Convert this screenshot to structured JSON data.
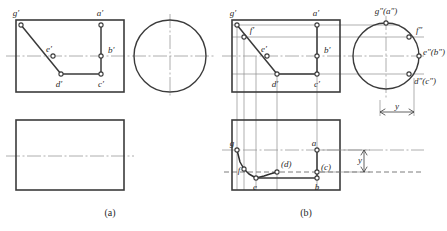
{
  "figure": {
    "captions": [
      {
        "id": "cap_a",
        "text": "(a)",
        "x": 110,
        "y": 216
      },
      {
        "id": "cap_b",
        "text": "(b)",
        "x": 306,
        "y": 216
      }
    ],
    "colors": {
      "outline": "#3b3b3b",
      "thin": "#8c8c8c",
      "center": "#9a9a9a",
      "text": "#2a2a2a",
      "marker_fill": "#ffffff",
      "curve": "#2f2f2f"
    }
  },
  "panel_a": {
    "name": "panel-a",
    "front_view": {
      "x": 16,
      "y": 20,
      "w": 108,
      "h": 72
    },
    "top_view": {
      "x": 16,
      "y": 120,
      "w": 108,
      "h": 70
    },
    "side_circle": {
      "cx": 170,
      "cy": 56,
      "r": 36
    },
    "polyline_points": "21,25 61,74 101,74",
    "segment_ab": "101,25 101,74",
    "center_lines": [
      {
        "id": "front_h",
        "x1": 6,
        "y1": 56,
        "x2": 214,
        "y2": 56
      },
      {
        "id": "circle_v",
        "x1": 170,
        "y1": 14,
        "x2": 170,
        "y2": 98
      },
      {
        "id": "top_h",
        "x1": 6,
        "y1": 156,
        "x2": 134,
        "y2": 156
      }
    ],
    "markers": [
      {
        "id": "g1",
        "x": 21,
        "y": 25
      },
      {
        "id": "a1",
        "x": 101,
        "y": 25
      },
      {
        "id": "b1",
        "x": 101,
        "y": 56
      },
      {
        "id": "e1",
        "x": 53,
        "y": 56
      },
      {
        "id": "d1",
        "x": 61,
        "y": 74
      },
      {
        "id": "c1",
        "x": 101,
        "y": 74
      }
    ],
    "labels": [
      {
        "id": "lbl_g1",
        "text": "g′",
        "x": 16,
        "y": 16,
        "anchor": "middle",
        "size": 9
      },
      {
        "id": "lbl_a1",
        "text": "a′",
        "x": 100,
        "y": 16,
        "anchor": "middle",
        "size": 9
      },
      {
        "id": "lbl_b1",
        "text": "b′",
        "x": 108,
        "y": 53,
        "anchor": "start",
        "size": 9
      },
      {
        "id": "lbl_e1",
        "text": "e′",
        "x": 49,
        "y": 52,
        "anchor": "middle",
        "size": 9
      },
      {
        "id": "lbl_d1",
        "text": "d′",
        "x": 59,
        "y": 87,
        "anchor": "middle",
        "size": 9
      },
      {
        "id": "lbl_c1",
        "text": "c′",
        "x": 101,
        "y": 87,
        "anchor": "middle",
        "size": 9
      }
    ]
  },
  "panel_b": {
    "name": "panel-b",
    "front_view": {
      "x": 232,
      "y": 20,
      "w": 108,
      "h": 72
    },
    "top_view": {
      "x": 232,
      "y": 120,
      "w": 108,
      "h": 70
    },
    "side_circle": {
      "cx": 386,
      "cy": 56,
      "r": 33
    },
    "polyline_points": "237,25 277,74 317,74",
    "segment_ab": "317,25 317,74",
    "front_center_h": {
      "x1": 222,
      "y1": 56,
      "x2": 424,
      "y2": 56
    },
    "circle_center_v": {
      "x1": 386,
      "y1": 16,
      "x2": 386,
      "y2": 100
    },
    "top_center_h": {
      "x1": 222,
      "y1": 150,
      "x2": 424,
      "y2": 150
    },
    "top_dash_h": {
      "x1": 224,
      "y1": 172,
      "x2": 424,
      "y2": 172
    },
    "projection_h_lines": [
      {
        "id": "ph_g",
        "x1": 232,
        "y1": 25,
        "x2": 400,
        "y2": 25
      },
      {
        "id": "ph_f",
        "x1": 232,
        "y1": 37,
        "x2": 424,
        "y2": 37
      },
      {
        "id": "ph_c",
        "x1": 232,
        "y1": 74,
        "x2": 424,
        "y2": 74
      }
    ],
    "projection_v_lines": [
      {
        "id": "pv_g",
        "x1": 237,
        "y1": 25,
        "x2": 237,
        "y2": 190
      },
      {
        "id": "pv_f",
        "x1": 244,
        "y1": 37,
        "x2": 244,
        "y2": 190
      },
      {
        "id": "pv_e",
        "x1": 256,
        "y1": 56,
        "x2": 256,
        "y2": 190
      },
      {
        "id": "pv_d",
        "x1": 277,
        "y1": 74,
        "x2": 277,
        "y2": 190
      },
      {
        "id": "pv_c",
        "x1": 317,
        "y1": 25,
        "x2": 317,
        "y2": 190
      }
    ],
    "front_markers": [
      {
        "id": "g1",
        "x": 237,
        "y": 25
      },
      {
        "id": "f1",
        "x": 244,
        "y": 37
      },
      {
        "id": "e1",
        "x": 267,
        "y": 56
      },
      {
        "id": "a1",
        "x": 317,
        "y": 25
      },
      {
        "id": "b1",
        "x": 317,
        "y": 56
      },
      {
        "id": "d1",
        "x": 277,
        "y": 74
      },
      {
        "id": "c1",
        "x": 317,
        "y": 74
      }
    ],
    "front_labels": [
      {
        "id": "lbl_g1",
        "text": "g′",
        "x": 233,
        "y": 16,
        "anchor": "middle",
        "size": 9
      },
      {
        "id": "lbl_f1",
        "text": "f′",
        "x": 252,
        "y": 33,
        "anchor": "middle",
        "size": 9
      },
      {
        "id": "lbl_e1",
        "text": "e′",
        "x": 264,
        "y": 52,
        "anchor": "middle",
        "size": 9
      },
      {
        "id": "lbl_a1",
        "text": "a′",
        "x": 316,
        "y": 16,
        "anchor": "middle",
        "size": 9
      },
      {
        "id": "lbl_b1",
        "text": "b′",
        "x": 324,
        "y": 53,
        "anchor": "start",
        "size": 9
      },
      {
        "id": "lbl_d1",
        "text": "d′",
        "x": 275,
        "y": 87,
        "anchor": "middle",
        "size": 9
      },
      {
        "id": "lbl_c1",
        "text": "c′",
        "x": 317,
        "y": 87,
        "anchor": "middle",
        "size": 9
      }
    ],
    "circle_markers": [
      {
        "id": "g2a2",
        "x": 386,
        "y": 23
      },
      {
        "id": "f2",
        "x": 409,
        "y": 37
      },
      {
        "id": "e2b2",
        "x": 419,
        "y": 56
      },
      {
        "id": "d2c2",
        "x": 409,
        "y": 74
      }
    ],
    "circle_labels": [
      {
        "id": "lbl_g2",
        "text": "g″(a″)",
        "x": 386,
        "y": 14,
        "anchor": "middle",
        "size": 9
      },
      {
        "id": "lbl_f2",
        "text": "f″",
        "x": 416,
        "y": 33,
        "anchor": "start",
        "size": 9
      },
      {
        "id": "lbl_e2",
        "text": "e″(b″)",
        "x": 423,
        "y": 55,
        "anchor": "start",
        "size": 9
      },
      {
        "id": "lbl_d2",
        "text": "d″(c″)",
        "x": 414,
        "y": 84,
        "anchor": "start",
        "size": 9
      }
    ],
    "top_curve": "237,150 240,162 244,169 249,174 256,178 264,176 270,174 277,172",
    "top_line_e_b": "256,178 317,178",
    "top_seg_ab": "317,150 317,178",
    "top_markers": [
      {
        "id": "g",
        "x": 237,
        "y": 150
      },
      {
        "id": "f",
        "x": 244,
        "y": 169
      },
      {
        "id": "e",
        "x": 256,
        "y": 178
      },
      {
        "id": "d",
        "x": 277,
        "y": 172
      },
      {
        "id": "a",
        "x": 317,
        "y": 150
      },
      {
        "id": "c",
        "x": 317,
        "y": 172
      },
      {
        "id": "b",
        "x": 317,
        "y": 178
      }
    ],
    "top_labels": [
      {
        "id": "lbl_g",
        "text": "g",
        "x": 232,
        "y": 146,
        "anchor": "middle",
        "size": 9
      },
      {
        "id": "lbl_f",
        "text": "f",
        "x": 239,
        "y": 173,
        "anchor": "middle",
        "size": 9
      },
      {
        "id": "lbl_e",
        "text": "e",
        "x": 255,
        "y": 190,
        "anchor": "middle",
        "size": 9
      },
      {
        "id": "lbl_d",
        "text": "(d)",
        "x": 281,
        "y": 167,
        "anchor": "start",
        "size": 9
      },
      {
        "id": "lbl_a",
        "text": "a",
        "x": 314,
        "y": 146,
        "anchor": "middle",
        "size": 9
      },
      {
        "id": "lbl_c",
        "text": "(c)",
        "x": 321,
        "y": 170,
        "anchor": "start",
        "size": 9
      },
      {
        "id": "lbl_b",
        "text": "b",
        "x": 317,
        "y": 190,
        "anchor": "middle",
        "size": 9
      }
    ],
    "dimensions": [
      {
        "id": "dim_y_side",
        "label": "y",
        "orientation": "horizontal",
        "x1": 380,
        "x2": 414,
        "y": 112,
        "label_x": 397,
        "label_y": 109,
        "ext1": {
          "x": 380,
          "y1": 100,
          "y2": 116
        },
        "ext2": {
          "x": 414,
          "y1": 78,
          "y2": 116
        }
      },
      {
        "id": "dim_y_top",
        "label": "y",
        "orientation": "vertical",
        "y1": 150,
        "y2": 172,
        "x": 364,
        "label_x": 360,
        "label_y": 163,
        "ext1": {
          "y": 150,
          "x1": 320,
          "x2": 370
        },
        "ext2": {
          "y": 172,
          "x1": 320,
          "x2": 370
        }
      }
    ]
  }
}
